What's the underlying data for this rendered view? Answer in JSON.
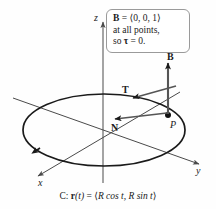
{
  "figure": {
    "background_color": "#fefefe",
    "stroke_color": "#1a1a1a",
    "axis_color": "#4a4a4a"
  },
  "axes": {
    "x_label": "x",
    "y_label": "y",
    "z_label": "z"
  },
  "callout": {
    "line1_vector": "B",
    "line1_equals": " = ⟨0, 0, 1⟩",
    "line2": "at all points,",
    "line3_prefix": "so ",
    "line3_symbol": "τ",
    "line3_suffix": " = 0.",
    "border_color": "#9a9a9a",
    "background_color": "#ffffff"
  },
  "vectors": [
    {
      "name": "binormal",
      "label": "B",
      "description": "vertical arrow upward from P"
    },
    {
      "name": "tangent",
      "label": "T",
      "description": "tangent arrow along the curve at P"
    },
    {
      "name": "normal",
      "label": "N",
      "description": "arrow from P toward the center of the circle"
    }
  ],
  "point": {
    "label": "P",
    "description": "point on the circle"
  },
  "caption": {
    "prefix": "C: ",
    "function": "r",
    "argument": "(t)",
    "equals": " = ⟨",
    "components": "R cos t, R sin t",
    "close": "⟩"
  }
}
